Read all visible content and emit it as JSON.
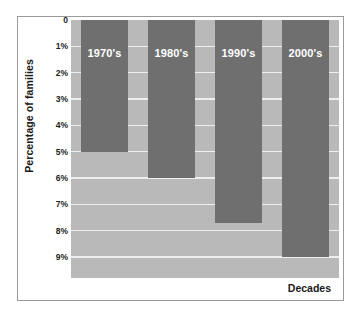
{
  "chart_data": {
    "type": "bar",
    "title": "",
    "subtitle": "",
    "categories": [
      "1970's",
      "1980's",
      "1990's",
      "2000's"
    ],
    "values": [
      5,
      6,
      7.7,
      9
    ],
    "series": [
      {
        "name": "Percentage of families",
        "values": [
          5,
          6,
          7.7,
          9
        ]
      }
    ],
    "xlabel": "Decades",
    "ylabel": "Percentage of families",
    "ylim": [
      0,
      9.8
    ],
    "y_axis_inverted": true,
    "y_ticks": [
      0,
      1,
      2,
      3,
      4,
      5,
      6,
      7,
      8,
      9
    ],
    "y_tick_labels": [
      "0",
      "1%",
      "2%",
      "3%",
      "4%",
      "5%",
      "6%",
      "7%",
      "8%",
      "9%"
    ],
    "grid": true,
    "legend": false,
    "legend_position": "none",
    "colors": {
      "bar": "#6f6f6f",
      "plot_background": "#b9b9b9",
      "gridline": "#eeeeee",
      "figure_background": "#ffffff",
      "frame_border": "#9a9a9a",
      "bar_label_text": "#ffffff",
      "axis_text": "#1a1a1a"
    },
    "annotations": [
      {
        "text": "1970's",
        "on_bar": 0
      },
      {
        "text": "1980's",
        "on_bar": 1
      },
      {
        "text": "1990's",
        "on_bar": 2
      },
      {
        "text": "2000's",
        "on_bar": 3
      }
    ]
  }
}
